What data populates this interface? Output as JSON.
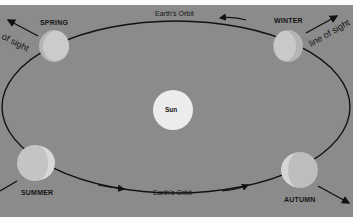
{
  "diagram": {
    "type": "orbit-diagram",
    "colors": {
      "background": "#8b8b8b",
      "top_strip": "#fbfbfb",
      "orbit_line": "#111111",
      "sun": "#ededed",
      "earth_lit": "#c9c9c9",
      "earth_shadow": "#b3b3b3"
    },
    "center": {
      "label": "Sun"
    },
    "orbit_labels": {
      "top": "Earth's Orbit",
      "bottom": "Earth's Orbit"
    },
    "positions": [
      {
        "id": "spring",
        "label": "SPRING",
        "sight_label": "line of sight",
        "sight_visible": "e of sight"
      },
      {
        "id": "winter",
        "label": "WINTER",
        "sight_label": "line of sight"
      },
      {
        "id": "summer",
        "label": "SUMMER"
      },
      {
        "id": "autumn",
        "label": "AUTUMN"
      }
    ]
  }
}
